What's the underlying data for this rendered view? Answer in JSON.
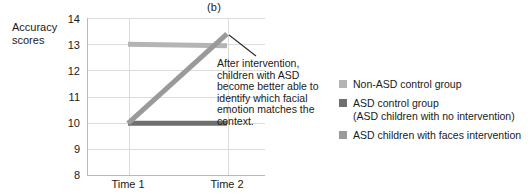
{
  "panel": {
    "label": "(b)"
  },
  "axes": {
    "y_title": "Accuracy scores",
    "y_ticks": [
      "14",
      "13",
      "12",
      "11",
      "10",
      "9",
      "8"
    ],
    "x_ticks": [
      "Time 1",
      "Time 2"
    ]
  },
  "annotation": {
    "text": "After intervention, children with ASD become better able to identify which facial emotion matches the context."
  },
  "legend": {
    "items": [
      {
        "label": "Non-ASD control group",
        "sub": "",
        "color": "#b4b4b4"
      },
      {
        "label": "ASD control group",
        "sub": "(ASD children with no intervention)",
        "color": "#6f6f6f"
      },
      {
        "label": "ASD children with faces intervention",
        "sub": "",
        "color": "#9a9a9a"
      }
    ]
  },
  "chart_data": {
    "type": "line",
    "title": "(b)",
    "xlabel": "",
    "ylabel": "Accuracy scores",
    "categories": [
      "Time 1",
      "Time 2"
    ],
    "ylim": [
      8,
      14
    ],
    "yticks": [
      8,
      9,
      10,
      11,
      12,
      13,
      14
    ],
    "grid": true,
    "legend_position": "right",
    "series": [
      {
        "name": "Non-ASD control group",
        "color": "#b4b4b4",
        "values": [
          13.0,
          12.95
        ]
      },
      {
        "name": "ASD control group (ASD children with no intervention)",
        "color": "#6f6f6f",
        "values": [
          10.0,
          10.0
        ]
      },
      {
        "name": "ASD children with faces intervention",
        "color": "#9a9a9a",
        "values": [
          10.0,
          13.4
        ]
      }
    ],
    "annotations": [
      {
        "text": "After intervention, children with ASD become better able to identify which facial emotion matches the context.",
        "points_to_series": "ASD children with faces intervention",
        "points_to_x": "Time 2"
      }
    ]
  }
}
